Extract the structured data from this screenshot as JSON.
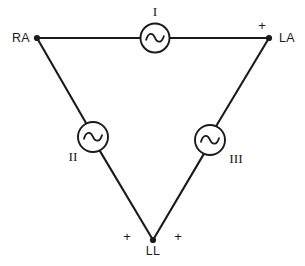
{
  "diagram": {
    "name": "Einthoven's triangle",
    "type": "schematic",
    "background_color": "#ffffff",
    "line_color": "#1a1a1a",
    "electrodes": [
      {
        "id": "RA",
        "label": "RA",
        "x": 37,
        "y": 38
      },
      {
        "id": "LA",
        "label": "LA",
        "x": 269,
        "y": 38
      },
      {
        "id": "LL",
        "label": "LL",
        "x": 153,
        "y": 240
      }
    ],
    "sources": [
      {
        "id": "I",
        "label": "I",
        "cx": 155,
        "cy": 38,
        "r": 14.5,
        "icon": "ac-source-icon"
      },
      {
        "id": "II",
        "label": "II",
        "cx": 93,
        "cy": 137,
        "r": 15,
        "icon": "ac-source-icon"
      },
      {
        "id": "III",
        "label": "III",
        "cx": 210,
        "cy": 140,
        "r": 15,
        "icon": "ac-source-icon"
      }
    ],
    "polarity_marks": [
      {
        "id": "plus-la",
        "label": "+",
        "x": 259,
        "y": 28
      },
      {
        "id": "plus-ll-left",
        "label": "+",
        "x": 126,
        "y": 239
      },
      {
        "id": "plus-ll-right",
        "label": "+",
        "x": 177,
        "y": 239
      }
    ],
    "edges": [
      {
        "id": "edge-ra-la",
        "from": "RA",
        "to": "LA",
        "lead": "I"
      },
      {
        "id": "edge-ra-ll",
        "from": "RA",
        "to": "LL",
        "lead": "II"
      },
      {
        "id": "edge-la-ll",
        "from": "LA",
        "to": "LL",
        "lead": "III"
      }
    ]
  }
}
